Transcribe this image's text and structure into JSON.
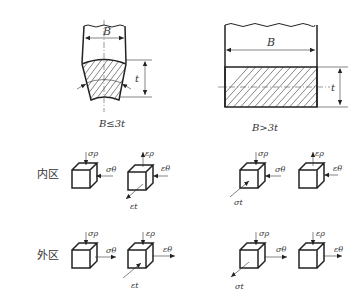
{
  "figures": {
    "narrow": {
      "width_label": "B",
      "thickness_label": "t",
      "caption": "B≤3t"
    },
    "wide": {
      "width_label": "B",
      "thickness_label": "t",
      "caption": "B>3t"
    }
  },
  "rows": {
    "inner": {
      "label": "内区"
    },
    "outer": {
      "label": "外区"
    }
  },
  "symbols": {
    "sigma_rho": "σρ",
    "sigma_theta": "σθ",
    "sigma_t": "σt",
    "eps_rho": "ερ",
    "eps_theta": "εθ",
    "eps_t": "εt"
  },
  "panels": {
    "inner_narrow_stress": {
      "top": "σρ",
      "side": "σθ"
    },
    "inner_narrow_strain": {
      "top": "ερ",
      "side": "εθ",
      "front": "εt"
    },
    "inner_wide_stress": {
      "top": "σρ",
      "side": "σθ",
      "front": "σt"
    },
    "inner_wide_strain": {
      "top": "ερ",
      "side": "εθ"
    },
    "outer_narrow_stress": {
      "top": "σρ",
      "side": "σθ"
    },
    "outer_narrow_strain": {
      "top": "ερ",
      "side": "εθ",
      "front": "εt"
    },
    "outer_wide_stress": {
      "top": "σρ",
      "side": "σθ",
      "front": "σt"
    },
    "outer_wide_strain": {
      "top": "ερ",
      "side": "εθ"
    }
  }
}
